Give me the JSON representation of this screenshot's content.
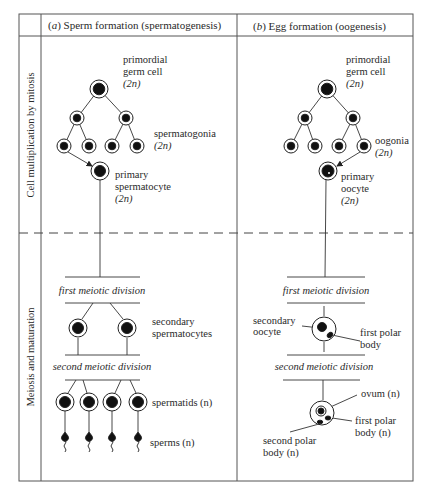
{
  "header": {
    "col_a": "(a)  Sperm formation (spermatogenesis)",
    "col_a_letter": "a",
    "col_a_title": "Sperm formation (spermatogenesis)",
    "col_b_letter": "b",
    "col_b_title": "Egg formation (oogenesis)"
  },
  "row_labels": {
    "top": "Cell multiplication by mitosis",
    "bottom": "Meiosis and maturation"
  },
  "spermatogenesis": {
    "primordial": [
      "primordial",
      "germ cell",
      "(2n)"
    ],
    "spermatogonia": [
      "spermatogonia",
      "(2n)"
    ],
    "primary": [
      "primary",
      "spermatocyte",
      "(2n)"
    ],
    "first_division": "first meiotic division",
    "secondary": [
      "secondary",
      "spermatocytes"
    ],
    "second_division": "second meiotic division",
    "spermatids": "spermatids (n)",
    "sperms": "sperms (n)"
  },
  "oogenesis": {
    "primordial": [
      "primordial",
      "germ cell",
      "(2n)"
    ],
    "oogonia": [
      "oogonia",
      "(2n)"
    ],
    "primary": [
      "primary",
      "oocyte",
      "(2n)"
    ],
    "first_division": "first meiotic division",
    "secondary_oocyte": [
      "secondary",
      "oocyte"
    ],
    "first_polar_body": [
      "first polar",
      "body"
    ],
    "second_division": "second meiotic division",
    "ovum": "ovum (n)",
    "first_polar_body_n": [
      "first polar",
      "body (n)"
    ],
    "second_polar_body": [
      "second polar",
      "body (n)"
    ]
  },
  "colors": {
    "line": "#3a3a3a",
    "cell": "#111111",
    "background": "#ffffff"
  }
}
